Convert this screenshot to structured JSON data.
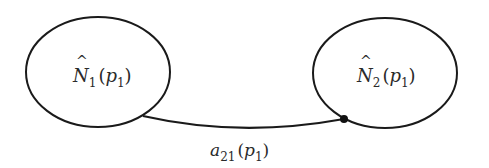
{
  "diagram": {
    "type": "node-link",
    "stroke_color": "#1a1a1a",
    "nodes": [
      {
        "id": "N1",
        "symbol": "N",
        "hat": "^",
        "subscript": "1",
        "arg_symbol": "p",
        "arg_subscript": "1",
        "open": "(",
        "close": ")"
      },
      {
        "id": "N2",
        "symbol": "N",
        "hat": "^",
        "subscript": "2",
        "arg_symbol": "p",
        "arg_subscript": "1",
        "open": "(",
        "close": ")"
      }
    ],
    "edges": [
      {
        "from": "N1",
        "to": "N2",
        "arrow": "dot",
        "label": {
          "symbol": "a",
          "subscript": "21",
          "arg_symbol": "p",
          "arg_subscript": "1",
          "open": "(",
          "close": ")"
        }
      }
    ]
  }
}
